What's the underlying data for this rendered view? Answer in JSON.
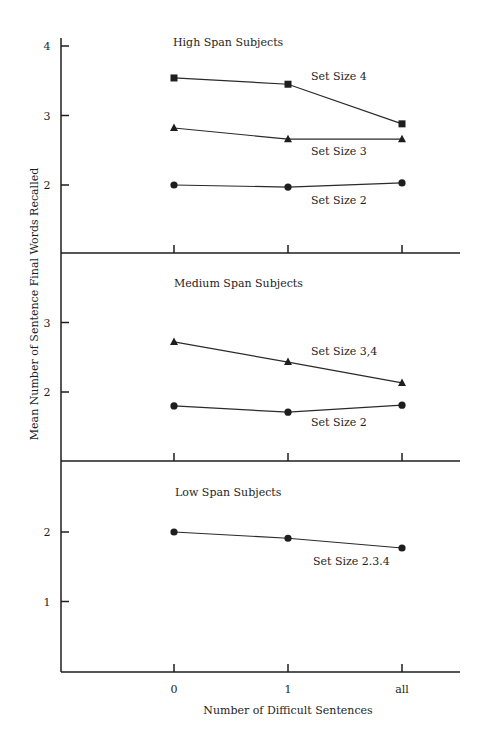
{
  "chart_data": {
    "type": "line",
    "xlabel": "Number of Difficult Sentences",
    "ylabel": "Mean Number of Sentence Final Words Recalled",
    "categories": [
      "0",
      "1",
      "all"
    ],
    "grid": false,
    "panels": [
      {
        "title": "High Span Subjects",
        "y_ticks": [
          2,
          3,
          4
        ],
        "ylim": [
          1,
          4.2
        ],
        "series": [
          {
            "name": "Set Size 4",
            "marker": "square",
            "values": [
              3.54,
              3.45,
              2.88
            ]
          },
          {
            "name": "Set Size 3",
            "marker": "triangle",
            "values": [
              2.82,
              2.66,
              2.66
            ]
          },
          {
            "name": "Set Size 2",
            "marker": "circle",
            "values": [
              2.0,
              1.97,
              2.03
            ]
          }
        ]
      },
      {
        "title": "Medium Span Subjects",
        "y_ticks": [
          2,
          3
        ],
        "ylim": [
          1,
          4
        ],
        "series": [
          {
            "name": "Set Size 3,4",
            "marker": "triangle",
            "values": [
              2.72,
              2.43,
              2.13
            ]
          },
          {
            "name": "Set Size 2",
            "marker": "circle",
            "values": [
              1.8,
              1.71,
              1.81
            ]
          }
        ]
      },
      {
        "title": "Low Span Subjects",
        "y_ticks": [
          1,
          2
        ],
        "ylim": [
          0,
          3
        ],
        "series": [
          {
            "name": "Set Size 2.3.4",
            "marker": "circle",
            "values": [
              2.0,
              1.91,
              1.77
            ]
          }
        ]
      }
    ]
  },
  "layout": {
    "axis_x": 61,
    "axis_right": 460,
    "x_positions": [
      174,
      288,
      402
    ],
    "px_per_unit": 69.5,
    "panels": [
      {
        "top": 38,
        "bottom": 253,
        "ref_value": 2,
        "ref_y": 185,
        "title_pos": [
          173,
          46
        ],
        "label_pos": [
          [
            311,
            80
          ],
          [
            311,
            145
          ],
          [
            311,
            204
          ]
        ]
      },
      {
        "top": 253,
        "bottom": 461,
        "ref_value": 2,
        "ref_y": 392,
        "title_pos": [
          174,
          287
        ],
        "label_pos": [
          [
            311,
            355
          ]
        ],
        "label_pos2": [
          [
            311,
            426
          ]
        ]
      },
      {
        "top": 461,
        "bottom": 672,
        "ref_value": 2,
        "ref_y": 532,
        "title_pos": [
          175,
          496
        ],
        "label_pos": [
          [
            313,
            565
          ]
        ]
      }
    ],
    "series_label_positions": [
      [
        [
          311,
          80
        ],
        [
          311,
          155
        ],
        [
          311,
          204
        ]
      ],
      [
        [
          311,
          355
        ],
        [
          311,
          426
        ]
      ],
      [
        [
          313,
          565
        ]
      ]
    ]
  }
}
